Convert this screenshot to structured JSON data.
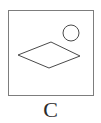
{
  "figure": {
    "caption": "C",
    "panel": {
      "name": "bordered-square-panel",
      "border_color": "#7d7d7d",
      "background_color": "#ffffff",
      "x": 8,
      "y": 10,
      "width": 86,
      "height": 86
    },
    "shapes": [
      {
        "name": "rhombus",
        "type": "polygon",
        "stroke_color": "#4a4a4a",
        "fill": "none",
        "points": "51,42 80,56 49,68 18,55"
      },
      {
        "name": "circle",
        "type": "circle",
        "stroke_color": "#4a4a4a",
        "fill": "none",
        "cx": 71,
        "cy": 33,
        "r": 8
      }
    ]
  },
  "chart_data": {
    "type": "diagram",
    "title": "C",
    "elements": [
      {
        "shape": "rhombus",
        "position": "center-left",
        "filled": false
      },
      {
        "shape": "circle",
        "position": "upper-right",
        "filled": false
      }
    ]
  }
}
